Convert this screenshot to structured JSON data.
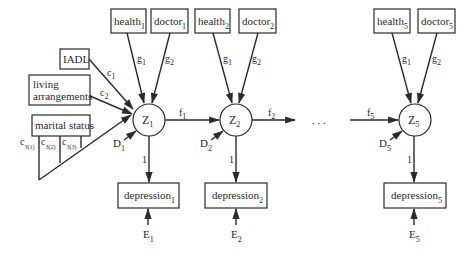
{
  "diagram": {
    "type": "path-diagram",
    "latent_nodes": [
      {
        "id": "Z1",
        "label": "Z",
        "sub": "1"
      },
      {
        "id": "Z2",
        "label": "Z",
        "sub": "2"
      },
      {
        "id": "Z5",
        "label": "Z",
        "sub": "5"
      }
    ],
    "observed_nodes": {
      "health1": {
        "label": "health",
        "sub": "1"
      },
      "doctor1": {
        "label": "doctor",
        "sub": "1"
      },
      "health2": {
        "label": "health",
        "sub": "2"
      },
      "doctor2": {
        "label": "doctor",
        "sub": "2"
      },
      "health5": {
        "label": "health",
        "sub": "5"
      },
      "doctor5": {
        "label": "doctor",
        "sub": "5"
      },
      "iadl": {
        "label": "IADL"
      },
      "living": {
        "line1": "living",
        "line2": "arrangements"
      },
      "marital": {
        "label": "marital status"
      },
      "depression1": {
        "label": "depression",
        "sub": "1"
      },
      "depression2": {
        "label": "depression",
        "sub": "2"
      },
      "depression5": {
        "label": "depression",
        "sub": "5"
      }
    },
    "coefficients": {
      "g1": {
        "label": "g",
        "sub": "1"
      },
      "g2": {
        "label": "g",
        "sub": "2"
      },
      "c1": {
        "label": "c",
        "sub": "1"
      },
      "c2": {
        "label": "c",
        "sub": "2"
      },
      "c31": {
        "label": "c",
        "sub": "3(1)"
      },
      "c32": {
        "label": "c",
        "sub": "3(2)"
      },
      "c33": {
        "label": "c",
        "sub": "3(3)"
      },
      "f1": {
        "label": "f",
        "sub": "1"
      },
      "f2": {
        "label": "f",
        "sub": "2"
      },
      "f5": {
        "label": "f",
        "sub": "5"
      },
      "one": "1"
    },
    "disturbances": {
      "D1": {
        "label": "D",
        "sub": "1"
      },
      "D2": {
        "label": "D",
        "sub": "2"
      },
      "D5": {
        "label": "D",
        "sub": "5"
      }
    },
    "errors": {
      "E1": {
        "label": "E",
        "sub": "1"
      },
      "E2": {
        "label": "E",
        "sub": "2"
      },
      "E5": {
        "label": "E",
        "sub": "5"
      }
    },
    "ellipsis": ". . ."
  }
}
